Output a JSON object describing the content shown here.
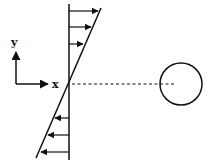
{
  "diagram": {
    "axes": {
      "x_label": "x",
      "y_label": "y"
    },
    "colors": {
      "ink": "#111111",
      "background": "#ffffff"
    },
    "profile": {
      "upper_arrow_count": 3,
      "lower_arrow_count": 3,
      "direction_upper": "right",
      "direction_lower": "left"
    },
    "particle": {
      "shape": "circle"
    }
  }
}
